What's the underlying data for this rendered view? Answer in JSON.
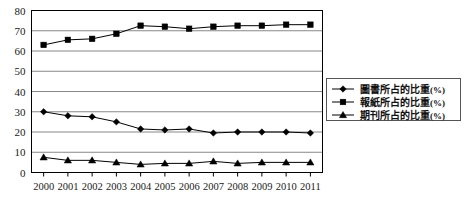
{
  "chart_data": {
    "type": "line",
    "title": "",
    "xlabel": "",
    "ylabel": "",
    "ylim": [
      0,
      80
    ],
    "ytick_step": 10,
    "grid": true,
    "legend_position": "right",
    "categories": [
      "2000",
      "2001",
      "2002",
      "2003",
      "2004",
      "2005",
      "2006",
      "2007",
      "2008",
      "2009",
      "2010",
      "2011"
    ],
    "yticks": [
      "0",
      "10",
      "20",
      "30",
      "40",
      "50",
      "60",
      "70",
      "80"
    ],
    "series": [
      {
        "name": "圖書所占的比重(%)",
        "label_text": "圖書所占的比重",
        "unit_text": "(%)",
        "marker": "diamond",
        "color": "#000000",
        "values": [
          30,
          28,
          27.5,
          25,
          21.5,
          21,
          21.5,
          19.5,
          20,
          20,
          20,
          19.5
        ]
      },
      {
        "name": "報紙所占的比重(%)",
        "label_text": "報紙所占的比重",
        "unit_text": "(%)",
        "marker": "square",
        "color": "#000000",
        "values": [
          63,
          65.5,
          66,
          68.5,
          72.5,
          72,
          71,
          72,
          72.5,
          72.5,
          73,
          73
        ]
      },
      {
        "name": "期刊所占的比重(%)",
        "label_text": "期刊所占的比重",
        "unit_text": "(%)",
        "marker": "triangle",
        "color": "#000000",
        "values": [
          7.5,
          6,
          6,
          5,
          4,
          4.5,
          4.5,
          5.5,
          4.5,
          5,
          5,
          5
        ]
      }
    ]
  },
  "colors": {
    "axis": "#000000",
    "grid": "#888888",
    "plot_background": "#ffffff",
    "legend_border": "#555555",
    "marker": "#000000"
  }
}
